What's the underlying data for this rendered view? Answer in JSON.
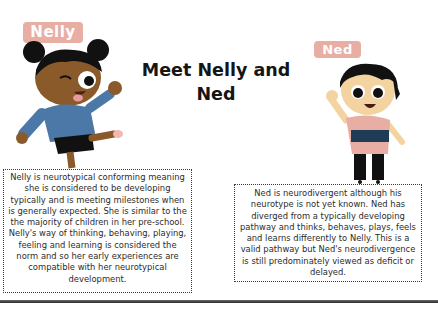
{
  "title": "Meet Nelly and Ned",
  "characters": {
    "nelly": {
      "name": "Nelly",
      "description": "Nelly is neurotypical conforming meaning she is considered to be developing typically and is meeting milestones when is generally expected. She is similar to the the majority of children in her pre-school. Nelly's way of thinking, behaving, playing, feeling and learning is considered the norm and so her early experiences are compatible with her neurotypical development."
    },
    "ned": {
      "name": "Ned",
      "description": "Ned is neurodivergent although his neurotype is not yet known. Ned has diverged from a typically developing pathway and thinks, behaves, plays, feels and learns differently to Nelly. This is a valid pathway but Ned's neurodivergence is still predominately viewed as deficit or delayed."
    }
  },
  "colors": {
    "name_tag_bg": "#e8aea3",
    "name_tag_text": "#ffffff",
    "title_text": "#151515",
    "border": "#3a3a3a"
  }
}
